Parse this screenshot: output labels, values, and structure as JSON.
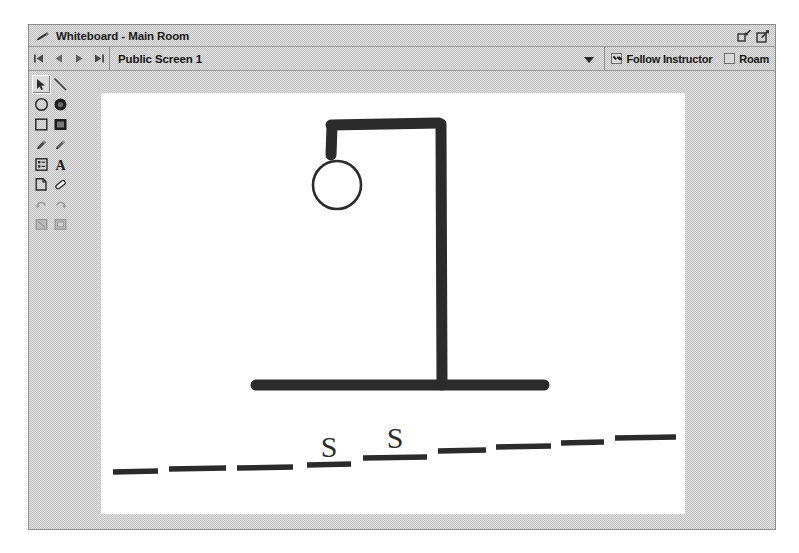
{
  "window": {
    "title": "Whiteboard - Main Room",
    "title_icon": "pencil-icon",
    "controls": [
      {
        "name": "restore-window-button",
        "icon": "restore-down-icon"
      },
      {
        "name": "maximize-window-button",
        "icon": "maximize-icon"
      }
    ]
  },
  "navbar": {
    "buttons": [
      {
        "name": "first-screen-button",
        "icon": "skip-back-icon"
      },
      {
        "name": "previous-screen-button",
        "icon": "step-back-icon"
      },
      {
        "name": "next-screen-button",
        "icon": "step-forward-icon"
      },
      {
        "name": "last-screen-button",
        "icon": "skip-forward-icon"
      }
    ],
    "screen_selector": {
      "value": "Public Screen 1",
      "icon": "chevron-down-icon"
    },
    "checkboxes": [
      {
        "name": "follow-instructor-checkbox",
        "label": "Follow Instructor",
        "checked": true
      },
      {
        "name": "roam-checkbox",
        "label": "Roam",
        "checked": false
      }
    ]
  },
  "toolbar": {
    "tools": [
      {
        "name": "select-tool",
        "icon": "arrow-cursor-icon",
        "selected": true,
        "disabled": false
      },
      {
        "name": "line-tool",
        "icon": "line-icon",
        "selected": false,
        "disabled": false
      },
      {
        "name": "ellipse-outline-tool",
        "icon": "circle-outline-icon",
        "selected": false,
        "disabled": false
      },
      {
        "name": "ellipse-filled-tool",
        "icon": "circle-filled-icon",
        "selected": false,
        "disabled": false
      },
      {
        "name": "rectangle-outline-tool",
        "icon": "square-outline-icon",
        "selected": false,
        "disabled": false
      },
      {
        "name": "rectangle-filled-tool",
        "icon": "square-filled-icon",
        "selected": false,
        "disabled": false
      },
      {
        "name": "marker-tool",
        "icon": "marker-pen-icon",
        "selected": false,
        "disabled": false
      },
      {
        "name": "pencil-tool",
        "icon": "pencil-icon",
        "selected": false,
        "disabled": false
      },
      {
        "name": "insert-object-tool",
        "icon": "document-object-icon",
        "selected": false,
        "disabled": false
      },
      {
        "name": "text-tool",
        "icon": "text-a-icon",
        "selected": false,
        "disabled": false
      },
      {
        "name": "new-page-tool",
        "icon": "page-add-icon",
        "selected": false,
        "disabled": false
      },
      {
        "name": "eraser-tool",
        "icon": "eraser-icon",
        "selected": false,
        "disabled": false
      },
      {
        "name": "undo-tool",
        "icon": "undo-icon",
        "selected": false,
        "disabled": true
      },
      {
        "name": "redo-tool",
        "icon": "redo-icon",
        "selected": false,
        "disabled": true
      },
      {
        "name": "clear-tool",
        "icon": "clear-board-icon",
        "selected": false,
        "disabled": true
      },
      {
        "name": "print-tool",
        "icon": "print-icon",
        "selected": false,
        "disabled": true
      }
    ]
  },
  "canvas": {
    "name": "whiteboard-drawing-area",
    "background": "#ffffff",
    "ink_color": "#2b2b2b",
    "drawing": {
      "type": "hangman-sketch",
      "gallows": {
        "base_line": {
          "x1": 155,
          "y1": 292,
          "x2": 442,
          "y2": 292
        },
        "upright": {
          "x1": 342,
          "y1": 292,
          "x2": 342,
          "y2": 30
        },
        "top_beam": {
          "x1": 342,
          "y1": 30,
          "x2": 230,
          "y2": 30
        },
        "rope": {
          "x1": 230,
          "y1": 30,
          "x2": 230,
          "y2": 62
        }
      },
      "head": {
        "cx": 236,
        "cy": 92,
        "r": 24,
        "filled": false
      }
    },
    "word_puzzle": {
      "slot_count": 9,
      "letters": [
        "",
        "",
        "",
        "S",
        "S",
        "",
        "",
        "",
        ""
      ],
      "revealed": [
        "S"
      ]
    }
  }
}
